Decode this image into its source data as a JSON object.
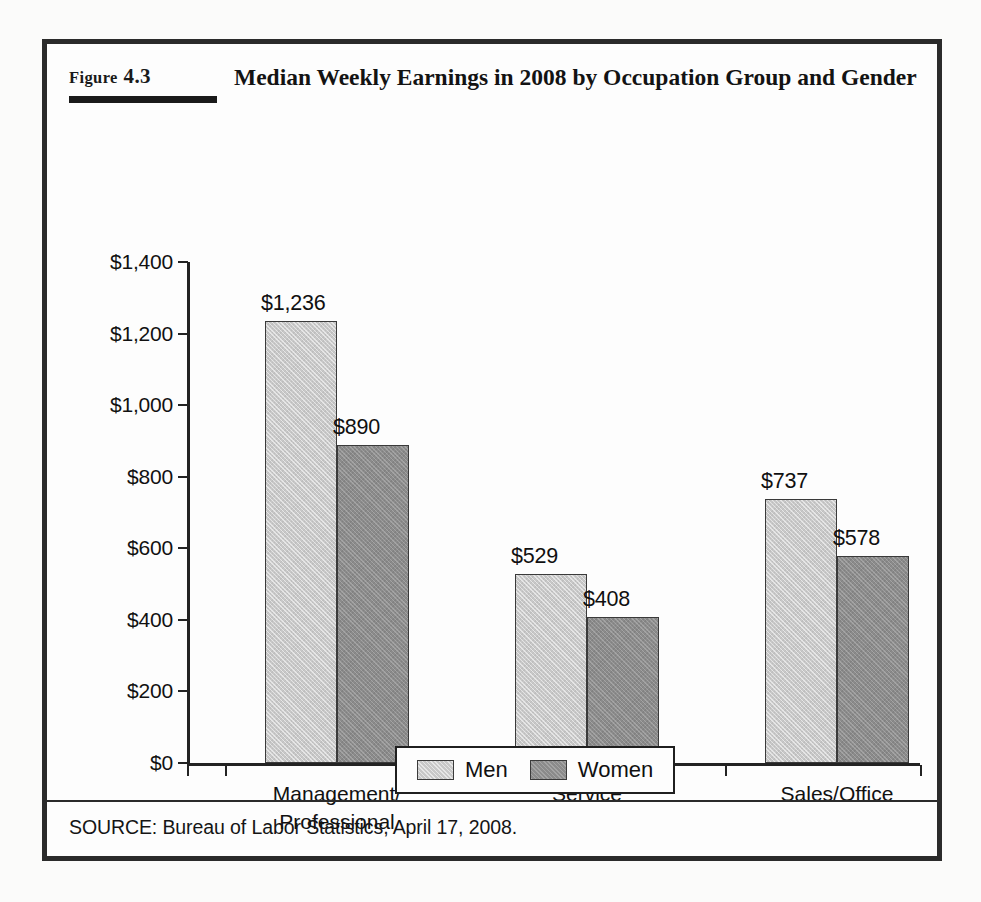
{
  "figure": {
    "label_prefix": "Figure",
    "label_number": "4.3",
    "title": "Median Weekly Earnings in 2008 by Occupation Group and Gender",
    "source": "SOURCE: Bureau of Labor Statistics, April 17, 2008."
  },
  "colors": {
    "men_fill": "#c8c8c8",
    "women_fill": "#8b8b8b",
    "axis": "#232323",
    "frame": "#2b2b2b",
    "background": "#fdfdfd"
  },
  "chart_data": {
    "type": "bar",
    "title": "Median Weekly Earnings in 2008 by Occupation Group and Gender",
    "xlabel": "",
    "ylabel": "",
    "ylim": [
      0,
      1400
    ],
    "ytick_step": 200,
    "grid": false,
    "legend_position": "bottom-center",
    "categories": [
      "Management/\nProfessional",
      "Service",
      "Sales/Office"
    ],
    "categories_flat": [
      "Management/Professional",
      "Service",
      "Sales/Office"
    ],
    "ytick_labels": [
      "$1,400",
      "$1,200",
      "$1,000",
      "$800",
      "$600",
      "$400",
      "$200",
      "$0"
    ],
    "ytick_values": [
      1400,
      1200,
      1000,
      800,
      600,
      400,
      200,
      0
    ],
    "series": [
      {
        "name": "Men",
        "values": [
          1236,
          529,
          737
        ],
        "labels": [
          "$1,236",
          "$529",
          "$737"
        ]
      },
      {
        "name": "Women",
        "values": [
          890,
          408,
          578
        ],
        "labels": [
          "$890",
          "$408",
          "$578"
        ]
      }
    ]
  }
}
